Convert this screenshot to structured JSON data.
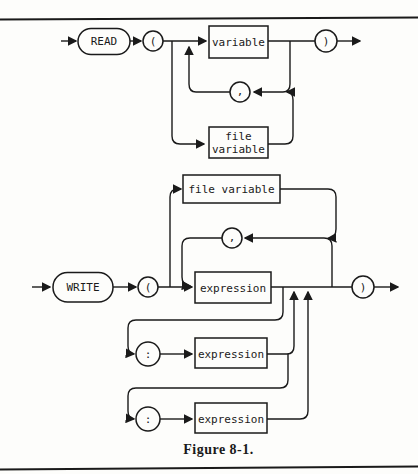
{
  "page": {
    "caption": "Figure 8-1."
  },
  "colors": {
    "ink": "#1a1a1a",
    "paper": "#fdfdfb"
  },
  "read_diagram": {
    "terminal": "READ",
    "open_paren": "(",
    "close_paren": ")",
    "variable": "variable",
    "comma": ",",
    "file_variable_line1": "file",
    "file_variable_line2": "variable"
  },
  "write_diagram": {
    "terminal": "WRITE",
    "open_paren": "(",
    "close_paren": ")",
    "file_variable": "file variable",
    "comma": ",",
    "expression": "expression",
    "colon_1": ":",
    "expression_width": "expression",
    "colon_2": ":",
    "expression_precision": "expression"
  }
}
